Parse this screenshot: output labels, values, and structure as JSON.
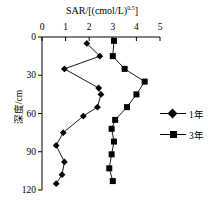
{
  "chart_data": {
    "type": "line",
    "title": "SAR/[(cmol/L)0.5]",
    "title_base": "SAR/[(cmol/L)",
    "title_exponent": "0.5",
    "title_close": "]",
    "xlabel": "SAR/[(cmol/L)0.5]",
    "ylabel": "深度/cm",
    "xlim": [
      0,
      5
    ],
    "ylim": [
      0,
      120
    ],
    "y_inverted": true,
    "xticks": [
      0,
      1,
      2,
      3,
      4,
      5
    ],
    "xtick_labels": [
      "0",
      "1",
      "2",
      "3",
      "4",
      "5"
    ],
    "yticks": [
      0,
      30,
      60,
      90,
      120
    ],
    "ytick_labels": [
      "0",
      "30",
      "60",
      "90",
      "120"
    ],
    "grid": false,
    "legend_position": "right",
    "line_color": "#000000",
    "marker_color": "#000000",
    "series": [
      {
        "name": "1年",
        "marker": "diamond",
        "x": [
          1.9,
          2.45,
          0.95,
          2.4,
          2.5,
          2.35,
          1.75,
          0.9,
          0.6,
          0.95,
          0.85,
          0.6
        ],
        "depth": [
          5,
          15,
          25,
          40,
          45,
          55,
          62,
          75,
          85,
          98,
          108,
          115
        ]
      },
      {
        "name": "3年",
        "marker": "square",
        "x": [
          3.05,
          3.0,
          3.5,
          4.35,
          4.0,
          3.6,
          3.1,
          2.95,
          3.05,
          2.95,
          2.85,
          3.0
        ],
        "depth": [
          3,
          15,
          25,
          35,
          45,
          55,
          65,
          72,
          82,
          92,
          103,
          113
        ]
      }
    ]
  },
  "legend": {
    "items": [
      {
        "label": "1年",
        "marker": "diamond"
      },
      {
        "label": "3年",
        "marker": "square"
      }
    ]
  }
}
